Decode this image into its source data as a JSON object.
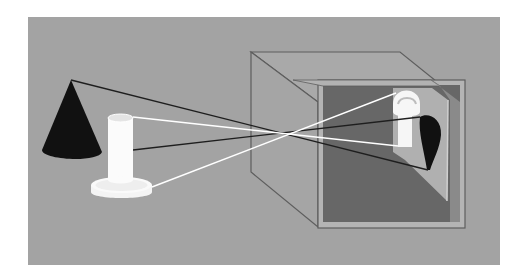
{
  "diagram": {
    "type": "camera-obscura-illustration",
    "colors": {
      "page_background": "#ffffff",
      "scene_background": "#a3a3a3",
      "box_side": "#a7a7a7",
      "box_edge": "#5e5e5e",
      "box_interior": "#6a6a6a",
      "back_wall": "#b0b0b0",
      "cone": "#111111",
      "cylinder": "#fafafa",
      "ray_dark": "#1e1e1e",
      "ray_light": "#ffffff"
    },
    "objects": [
      {
        "name": "cone",
        "color": "black",
        "position": "left"
      },
      {
        "name": "cylinder-on-disc",
        "color": "white",
        "position": "left-center"
      },
      {
        "name": "pinhole-box",
        "position": "right"
      },
      {
        "name": "inverted-cone-image",
        "color": "black",
        "position": "inside-box"
      },
      {
        "name": "inverted-cylinder-image",
        "color": "white",
        "position": "inside-box"
      }
    ],
    "rays": [
      {
        "from": "cone-apex",
        "to": "image-cone-apex",
        "color": "dark"
      },
      {
        "from": "cone-base",
        "to": "image-cone-base",
        "color": "dark"
      },
      {
        "from": "cylinder-top",
        "to": "image-cylinder-top",
        "color": "light"
      },
      {
        "from": "cylinder-base",
        "to": "image-cylinder-base",
        "color": "light"
      }
    ]
  }
}
